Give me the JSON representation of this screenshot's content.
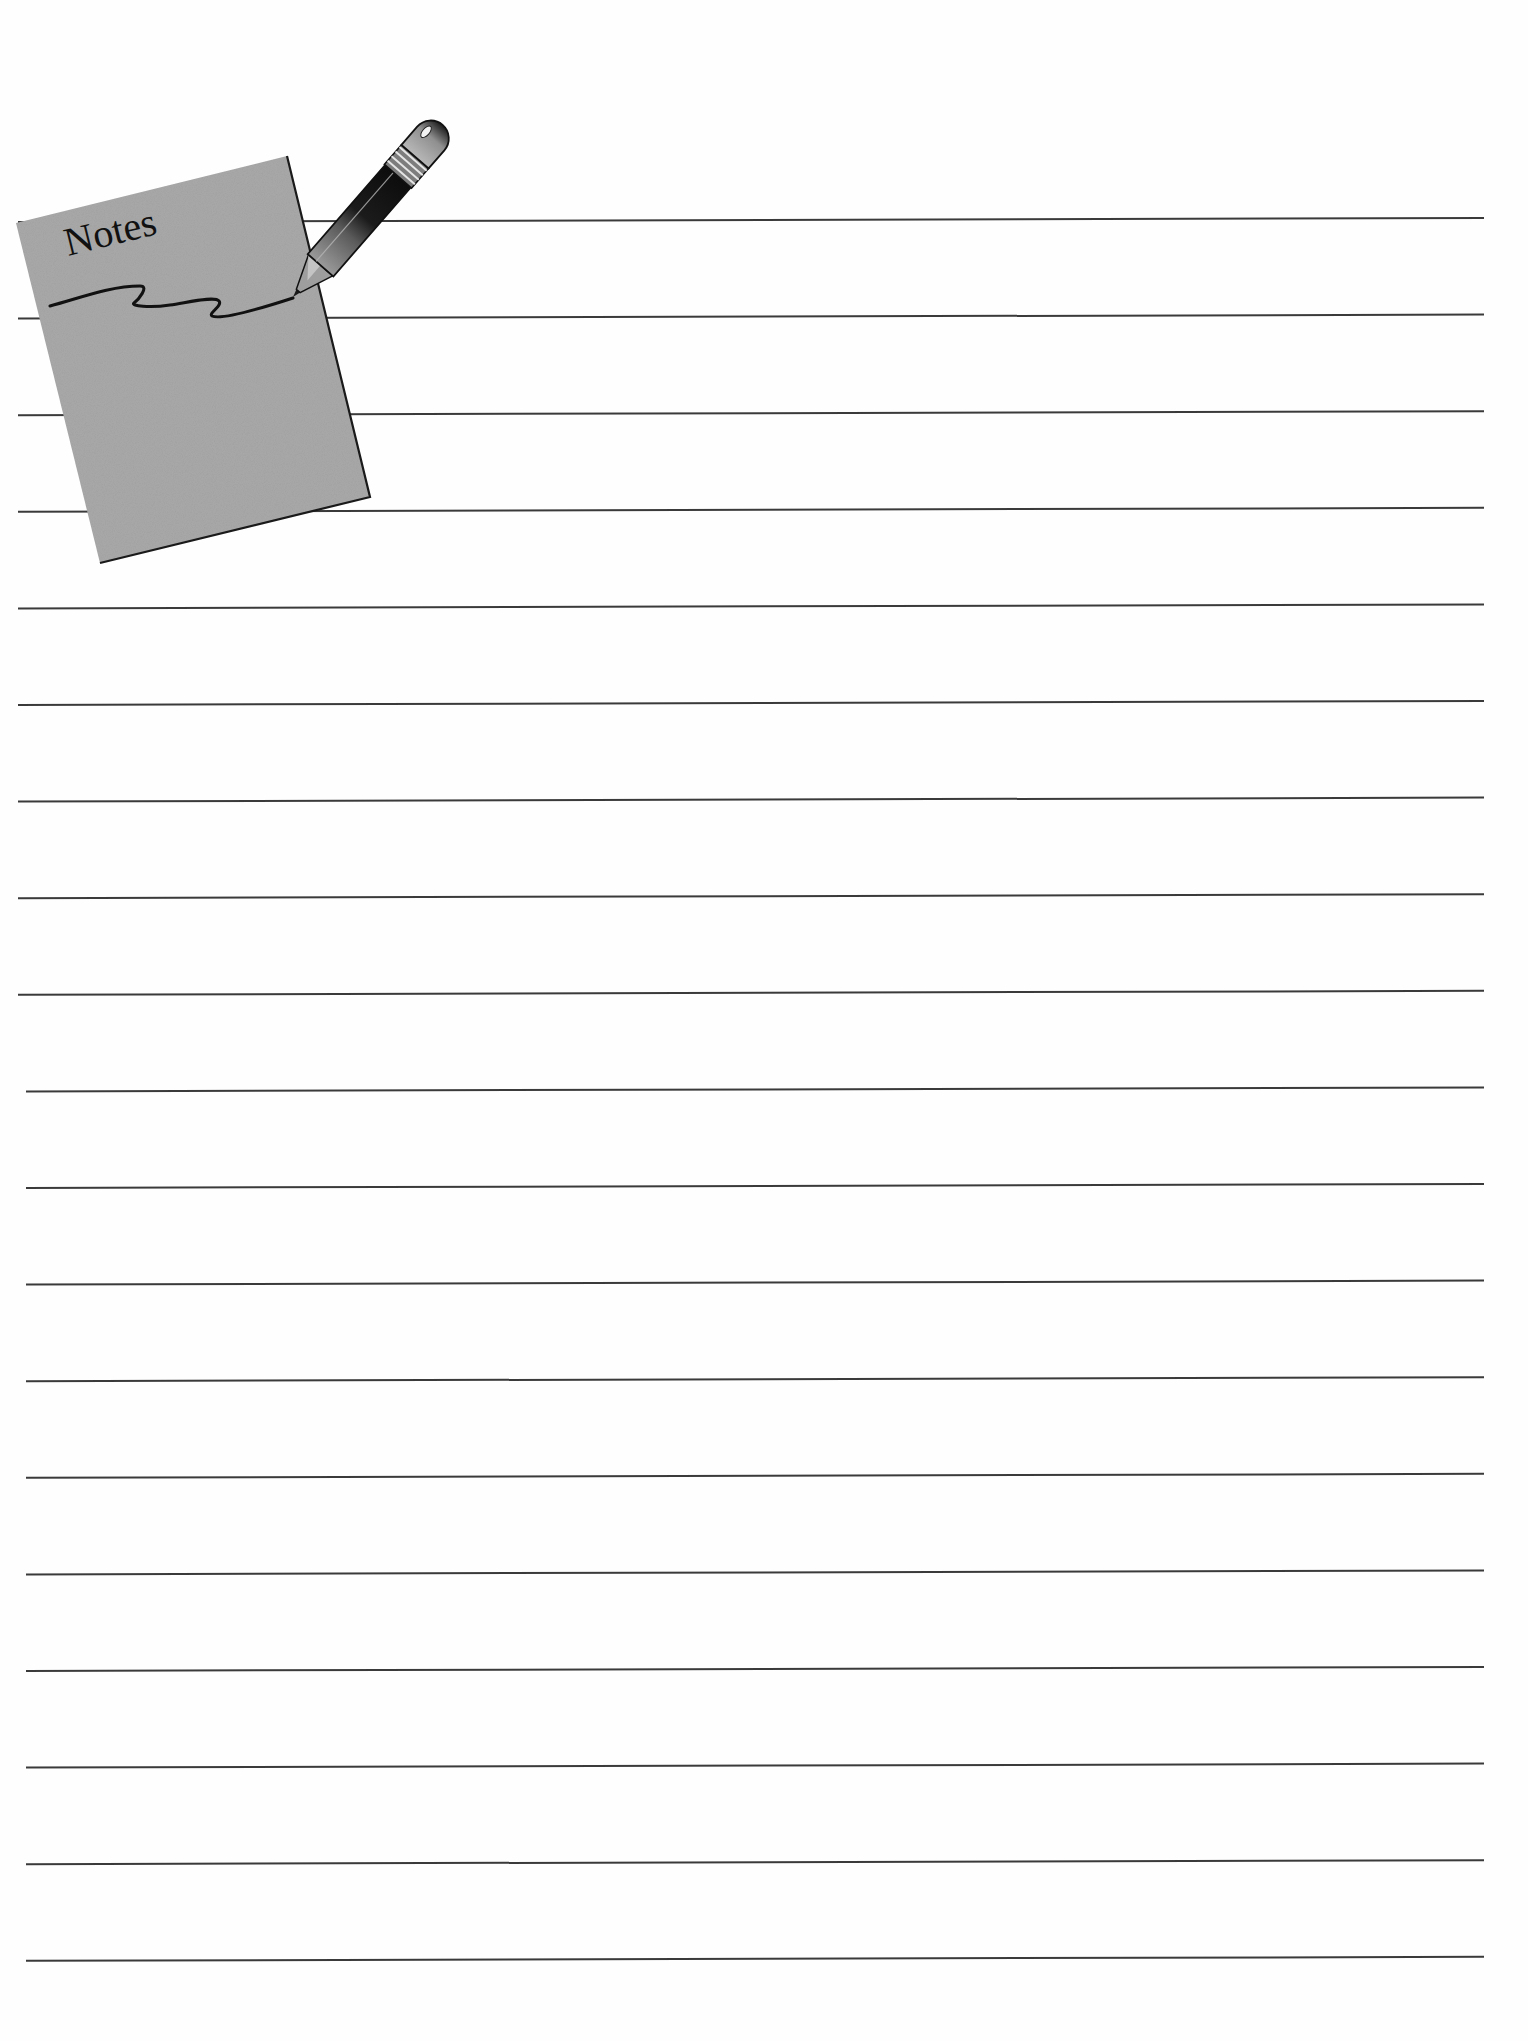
{
  "document": {
    "type": "lined notes page",
    "background_color": "#ffffff",
    "line_color": "#3a3a3a"
  },
  "illustration": {
    "pad_label": "Notes",
    "pad_color": "#a9a9a9",
    "pad_edge_color": "#1a1a1a",
    "pencil_body_color": "#2a2a2a",
    "pencil_highlight_color": "#8c8c8c"
  },
  "ruled_lines": {
    "count": 19,
    "first_y": 222,
    "spacing": 96.6,
    "x_start": 18,
    "x_end": 1484,
    "tilt_px": -4
  }
}
